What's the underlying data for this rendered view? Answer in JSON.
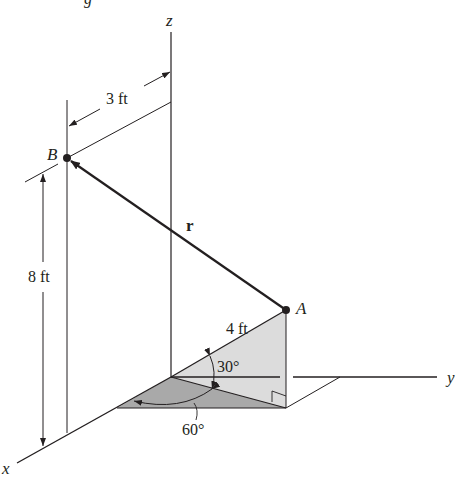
{
  "figure": {
    "top_cropped_text": "g",
    "axes": {
      "x": "x",
      "y": "y",
      "z": "z"
    },
    "points": {
      "A": "A",
      "B": "B"
    },
    "vector_label": "r",
    "dimensions": {
      "horizontal_offset": "3 ft",
      "height": "8 ft",
      "length_OA": "4 ft"
    },
    "angles": {
      "elevation": "30°",
      "azimuth": "60°"
    },
    "colors": {
      "line": "#231f20",
      "light_fill": "#dcdcdc",
      "dark_fill": "#a9a9a9",
      "background": "#ffffff"
    }
  }
}
